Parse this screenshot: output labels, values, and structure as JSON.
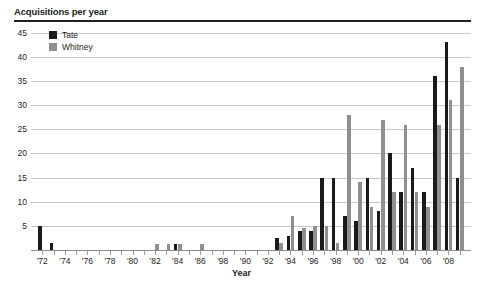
{
  "chart_data": {
    "type": "bar",
    "title": "Acquisitions per year",
    "xlabel": "Year",
    "ylabel": "",
    "grid": true,
    "legend_position": "top-left-inside",
    "ylim": [
      0,
      46
    ],
    "ytick_values": [
      5,
      10,
      15,
      20,
      25,
      30,
      35,
      40,
      45
    ],
    "ytick_labels": [
      "5",
      "10",
      "15",
      "20",
      "25",
      "30",
      "35",
      "40",
      "45"
    ],
    "x": [
      "1972",
      "1973",
      "1974",
      "1975",
      "1976",
      "1977",
      "1978",
      "1979",
      "1980",
      "1981",
      "1982",
      "1983",
      "1984",
      "1985",
      "1986",
      "1987",
      "1988",
      "1989",
      "1990",
      "1991",
      "1992",
      "1993",
      "1994",
      "1995",
      "1996",
      "1997",
      "1998",
      "1999",
      "2000",
      "2001",
      "2002",
      "2003",
      "2004",
      "2005",
      "2006",
      "2007",
      "2008",
      "2009"
    ],
    "xtick_labels": [
      "'72",
      "",
      "'74",
      "",
      "'76",
      "",
      "'78",
      "",
      "'80",
      "",
      "'82",
      "",
      "'84",
      "",
      "'86",
      "",
      "'98",
      "",
      "'90",
      "",
      "'92",
      "",
      "'94",
      "",
      "'96",
      "",
      "'98",
      "",
      "'00",
      "",
      "'02",
      "",
      "'04",
      "",
      "'06",
      "",
      "'08",
      ""
    ],
    "series": [
      {
        "name": "Tate",
        "color": "#1a1a1a",
        "values": [
          5,
          1.5,
          0,
          0,
          0,
          0,
          0,
          0,
          0,
          0,
          0,
          0,
          1.3,
          0,
          0,
          0,
          0,
          0,
          0,
          0,
          0,
          2.5,
          3,
          4,
          4,
          15,
          15,
          7,
          6,
          15,
          8,
          20,
          12,
          17,
          12,
          36,
          43,
          15
        ]
      },
      {
        "name": "Whitney",
        "color": "#8f8f8f",
        "values": [
          0,
          0,
          0,
          0,
          0,
          0,
          0,
          0,
          0,
          0,
          1.3,
          1.3,
          1.3,
          0,
          1.3,
          0,
          0,
          0,
          0,
          0,
          0,
          1.5,
          7,
          4.5,
          5,
          5,
          1.5,
          28,
          14,
          9,
          27,
          12,
          26,
          12,
          9,
          26,
          31,
          38
        ]
      }
    ]
  },
  "legend": {
    "items": [
      {
        "label": "Tate",
        "color": "#1a1a1a"
      },
      {
        "label": "Whitney",
        "color": "#8f8f8f"
      }
    ]
  }
}
